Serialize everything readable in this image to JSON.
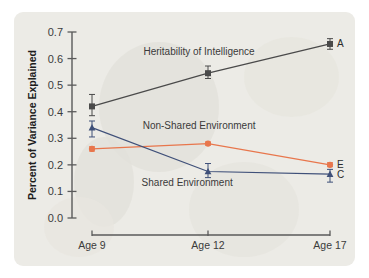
{
  "chart_data": {
    "type": "line",
    "title": "",
    "xlabel": "",
    "ylabel": "Percent of Variance Explained",
    "categories": [
      "Age 9",
      "Age 12",
      "Age 17"
    ],
    "ylim": [
      0.0,
      0.7
    ],
    "ytick_labels": [
      "0.0",
      "0.1",
      "0.2",
      "0.3",
      "0.4",
      "0.5",
      "0.6",
      "0.7"
    ],
    "ytick_values": [
      0.0,
      0.1,
      0.2,
      0.3,
      0.4,
      0.5,
      0.6,
      0.7
    ],
    "grid": false,
    "legend_position": "inline-right-endpoint-letters",
    "series": [
      {
        "name": "Heritability of Intelligence",
        "letter": "A",
        "color": "#4a4a4a",
        "marker": "square",
        "values": [
          0.42,
          0.545,
          0.655
        ],
        "err_low": [
          0.385,
          0.525,
          0.635
        ],
        "err_high": [
          0.465,
          0.572,
          0.675
        ]
      },
      {
        "name": "Non-Shared Environment",
        "letter": "E",
        "color": "#e8764c",
        "marker": "circle",
        "values": [
          0.26,
          0.28,
          0.2
        ],
        "err_low": [
          0.252,
          0.274,
          0.193
        ],
        "err_high": [
          0.268,
          0.286,
          0.208
        ]
      },
      {
        "name": "Shared Environment",
        "letter": "C",
        "color": "#3f5079",
        "marker": "triangle",
        "values": [
          0.34,
          0.175,
          0.165
        ],
        "err_low": [
          0.305,
          0.152,
          0.135
        ],
        "err_high": [
          0.365,
          0.205,
          0.183
        ]
      }
    ],
    "annotations": [
      {
        "text": "Heritability of Intelligence",
        "x": 0.45,
        "y": 0.615
      },
      {
        "text": "Non-Shared Environment",
        "x": 0.45,
        "y": 0.335
      },
      {
        "text": "Shared Environment",
        "x": 0.4,
        "y": 0.12
      }
    ]
  }
}
